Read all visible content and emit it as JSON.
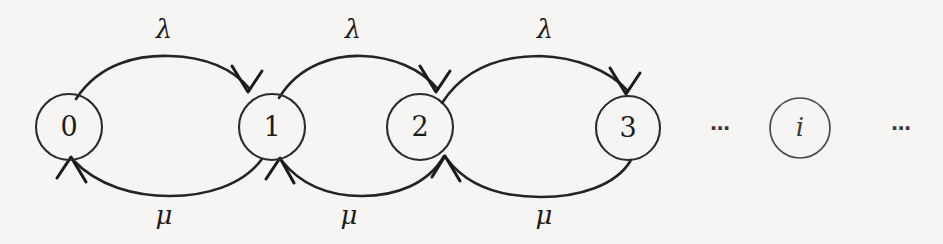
{
  "diagram": {
    "background_color": "#f7f5f3",
    "stroke_color": "#242424",
    "states": [
      {
        "id": "state-0",
        "label": "0",
        "cx": 69,
        "cy": 127,
        "r": 33,
        "italic": false,
        "faint": false
      },
      {
        "id": "state-1",
        "label": "1",
        "cx": 272,
        "cy": 127,
        "r": 33,
        "italic": false,
        "faint": false
      },
      {
        "id": "state-2",
        "label": "2",
        "cx": 420,
        "cy": 127,
        "r": 33,
        "italic": false,
        "faint": false
      },
      {
        "id": "state-3",
        "label": "3",
        "cx": 628,
        "cy": 128,
        "r": 32,
        "italic": false,
        "faint": false
      },
      {
        "id": "state-i",
        "label": "i",
        "cx": 800,
        "cy": 128,
        "r": 30,
        "italic": true,
        "faint": true
      }
    ],
    "transitions": [
      {
        "id": "arrival-0-1",
        "from": "0",
        "to": "1",
        "direction": "forward",
        "rate_label": "λ",
        "label_x": 164,
        "label_y": 31
      },
      {
        "id": "arrival-1-2",
        "from": "1",
        "to": "2",
        "direction": "forward",
        "rate_label": "λ",
        "label_x": 353,
        "label_y": 31
      },
      {
        "id": "arrival-2-3",
        "from": "2",
        "to": "3",
        "direction": "forward",
        "rate_label": "λ",
        "label_x": 545,
        "label_y": 31
      },
      {
        "id": "service-1-0",
        "from": "1",
        "to": "0",
        "direction": "backward",
        "rate_label": "μ",
        "label_x": 164,
        "label_y": 217
      },
      {
        "id": "service-2-1",
        "from": "2",
        "to": "1",
        "direction": "backward",
        "rate_label": "μ",
        "label_x": 349,
        "label_y": 217
      },
      {
        "id": "service-3-2",
        "from": "3",
        "to": "2",
        "direction": "backward",
        "rate_label": "μ",
        "label_x": 544,
        "label_y": 217
      }
    ],
    "ellipses": [
      {
        "id": "ellipsis-left",
        "label": "⋯",
        "x": 721,
        "y": 129
      },
      {
        "id": "ellipsis-right",
        "label": "⋯",
        "x": 902,
        "y": 129
      }
    ],
    "symbols": {
      "lambda": "λ",
      "mu": "μ",
      "ellipsis": "⋯"
    }
  }
}
